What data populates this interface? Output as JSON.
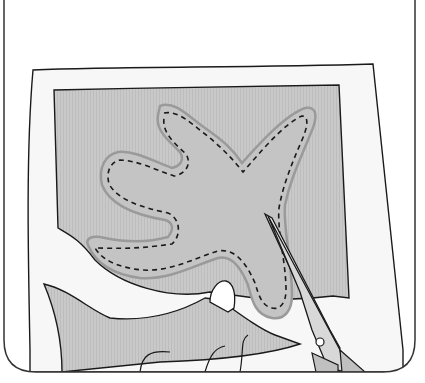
{
  "illustration": {
    "title": "Cutting out a hand-shaped fabric piece along the seam allowance",
    "elements": {
      "frame": "rounded-frame",
      "paper": "pattern-paper",
      "fabric": "fabric-sheet",
      "shape": "hand-shape",
      "stitch_line": "dashed-stitch-line",
      "scissors": "scissors",
      "hand": "holding-hand"
    },
    "colors": {
      "outline": "#1a1a1a",
      "paper": "#f7f7f7",
      "fabric": "#c8c8c8",
      "shape_fill": "#c4c4c4",
      "shape_halo": "#9a9a9a",
      "scissors_blade": "#e8e8e8",
      "scissors_handle": "#c0c0c0",
      "background": "#ffffff"
    }
  }
}
